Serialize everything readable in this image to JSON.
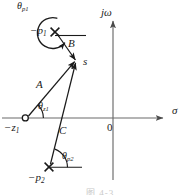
{
  "figure": {
    "type": "s-plane pole-zero vector diagram",
    "background_color": "#ffffff",
    "ink_color": "#1a1a1a",
    "axis_color": "#555555"
  },
  "axes": {
    "real_axis_label": "σ",
    "imag_axis_label": "jω",
    "origin_label": "0"
  },
  "points": {
    "test_point": {
      "label": "s",
      "marker": "none",
      "x": 77,
      "y": 62
    },
    "zero_1": {
      "label": "−z",
      "subscript": "1",
      "marker": "open-circle",
      "x": 25,
      "y": 118
    },
    "pole_1": {
      "label": "−p",
      "subscript": "1",
      "marker": "cross",
      "x": 55,
      "y": 32
    },
    "pole_2": {
      "label": "−p",
      "subscript": "2",
      "marker": "cross",
      "x": 49,
      "y": 167
    }
  },
  "vectors": [
    {
      "name": "A",
      "label": "A",
      "from": "zero_1",
      "to": "test_point",
      "label_x": 40,
      "label_y": 86
    },
    {
      "name": "B",
      "label": "B",
      "from": "pole_1",
      "to": "test_point",
      "label_x": 71,
      "label_y": 44
    },
    {
      "name": "C",
      "label": "C",
      "from": "pole_2",
      "to": "test_point",
      "label_x": 62,
      "label_y": 131
    }
  ],
  "angles": [
    {
      "name": "theta_z1",
      "label": "θ",
      "subscript": "z1",
      "at": "zero_1",
      "label_x": 40,
      "label_y": 105
    },
    {
      "name": "theta_p1",
      "label": "θ",
      "subscript": "p1",
      "at": "pole_1",
      "label_x": 19,
      "label_y": 2
    },
    {
      "name": "theta_p2",
      "label": "θ",
      "subscript": "p2",
      "at": "pole_2",
      "label_x": 64,
      "label_y": 155
    }
  ],
  "caption": {
    "text": "图 4-3",
    "visible": "partially-cropped"
  }
}
